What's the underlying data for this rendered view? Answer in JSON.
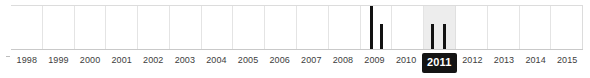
{
  "widget": {
    "name": "year-timeline-filter",
    "type": "timeline-histogram",
    "selected_year": "2011",
    "range_start": "1998",
    "range_end": "2015",
    "colors": {
      "bar": "#121212",
      "selected_badge_background": "#141414",
      "selected_badge_text": "#ffffff",
      "selected_column_background": "#ededed",
      "gridline": "#e4e4e4",
      "axis_line": "#c9c9c9",
      "label_text": "#3d3d3d",
      "page_background": "#ffffff"
    }
  },
  "chart_data": {
    "type": "bar",
    "title": "",
    "subtitle": "",
    "xlabel": "",
    "ylabel": "",
    "grid": true,
    "legend": null,
    "xlim": [
      "1998",
      "2015"
    ],
    "ylim": [
      0,
      100
    ],
    "categories": [
      "1998",
      "1999",
      "2000",
      "2001",
      "2002",
      "2003",
      "2004",
      "2005",
      "2006",
      "2007",
      "2008",
      "2009",
      "2010",
      "2011",
      "2012",
      "2013",
      "2014",
      "2015"
    ],
    "values": [
      0,
      0,
      0,
      0,
      0,
      0,
      0,
      0,
      0,
      0,
      0,
      100,
      0,
      58,
      0,
      0,
      0,
      0
    ],
    "bars": [
      {
        "label": "2009-early",
        "year": "2009",
        "offset_pct": 30,
        "height_pct": 100
      },
      {
        "label": "2009-late",
        "year": "2009",
        "offset_pct": 62,
        "height_pct": 58
      },
      {
        "label": "2011-early",
        "year": "2011",
        "offset_pct": 22,
        "height_pct": 58
      },
      {
        "label": "2011-late",
        "year": "2011",
        "offset_pct": 62,
        "height_pct": 58
      }
    ]
  },
  "axis": {
    "ticks": [
      {
        "label": "1998",
        "selected": false
      },
      {
        "label": "1999",
        "selected": false
      },
      {
        "label": "2000",
        "selected": false
      },
      {
        "label": "2001",
        "selected": false
      },
      {
        "label": "2002",
        "selected": false
      },
      {
        "label": "2003",
        "selected": false
      },
      {
        "label": "2004",
        "selected": false
      },
      {
        "label": "2005",
        "selected": false
      },
      {
        "label": "2006",
        "selected": false
      },
      {
        "label": "2007",
        "selected": false
      },
      {
        "label": "2008",
        "selected": false
      },
      {
        "label": "2009",
        "selected": false
      },
      {
        "label": "2010",
        "selected": false
      },
      {
        "label": "2011",
        "selected": true
      },
      {
        "label": "2012",
        "selected": false
      },
      {
        "label": "2013",
        "selected": false
      },
      {
        "label": "2014",
        "selected": false
      },
      {
        "label": "2015",
        "selected": false
      }
    ]
  }
}
